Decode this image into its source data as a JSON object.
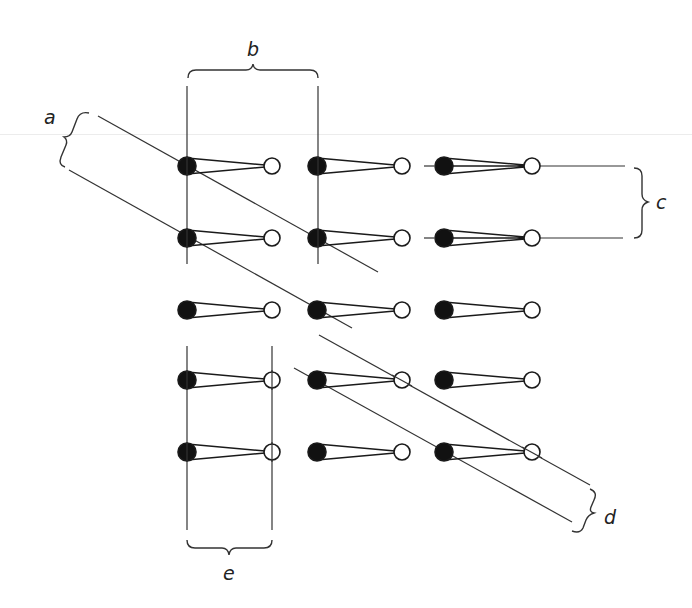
{
  "figure": {
    "colors": {
      "ink": "#1a1a1a",
      "line": "#333333",
      "background": "#ffffff"
    },
    "rows_y": [
      166,
      238,
      310,
      380,
      452
    ],
    "columns": [
      {
        "filled_x": 187,
        "open_x": 272
      },
      {
        "filled_x": 317,
        "open_x": 402
      },
      {
        "filled_x": 444,
        "open_x": 532
      }
    ]
  },
  "labels": {
    "a": "a",
    "b": "b",
    "c": "c",
    "d": "d",
    "e": "e"
  }
}
